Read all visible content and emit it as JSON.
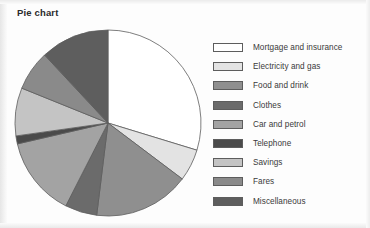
{
  "title": "Pie chart",
  "colors": {
    "slice_outline": "#5d5d5d",
    "text": "#3a3a3a",
    "title": "#2b2b2b",
    "background": "#fdfdfd"
  },
  "chart_data": {
    "type": "pie",
    "title": "Pie chart",
    "xlabel": "",
    "ylabel": "",
    "legend_position": "right",
    "grid": false,
    "start_angle_deg": 0,
    "direction": "clockwise",
    "categories": [
      "Mortgage and insurance",
      "Electricity and gas",
      "Food and drink",
      "Clothes",
      "Car and petrol",
      "Telephone",
      "Savings",
      "Fares",
      "Miscellaneous"
    ],
    "values": [
      29.7,
      5.6,
      16.7,
      5.6,
      13.9,
      1.4,
      8.3,
      6.9,
      11.9
    ],
    "angles_deg": [
      107,
      20,
      60,
      20,
      50,
      5,
      30,
      25,
      43
    ],
    "slice_colors": [
      "#ffffff",
      "#e3e3e3",
      "#8f8f8f",
      "#6b6b6b",
      "#a3a3a3",
      "#4a4a4a",
      "#c4c4c4",
      "#8a8a8a",
      "#5e5e5e"
    ]
  },
  "legend": {
    "items": [
      {
        "label": "Mortgage and insurance",
        "color": "#ffffff"
      },
      {
        "label": "Electricity and gas",
        "color": "#e3e3e3"
      },
      {
        "label": "Food and drink",
        "color": "#8f8f8f"
      },
      {
        "label": "Clothes",
        "color": "#6b6b6b"
      },
      {
        "label": "Car and petrol",
        "color": "#a3a3a3"
      },
      {
        "label": "Telephone",
        "color": "#4a4a4a"
      },
      {
        "label": "Savings",
        "color": "#c4c4c4"
      },
      {
        "label": "Fares",
        "color": "#8a8a8a"
      },
      {
        "label": "Miscellaneous",
        "color": "#5e5e5e"
      }
    ]
  },
  "pie_geometry": {
    "center_x": 108,
    "center_y": 123,
    "radius": 93
  }
}
